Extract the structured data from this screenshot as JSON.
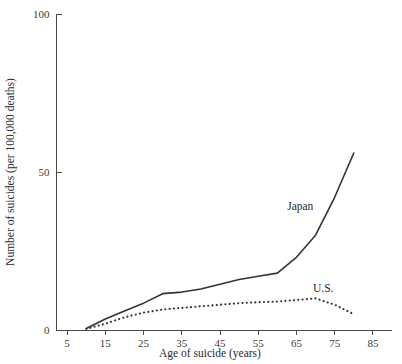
{
  "chart_data": {
    "type": "line",
    "title": "",
    "subtitle": "",
    "xlabel": "Age of suicide (years)",
    "ylabel": "Number of suicides (per 100,000 deaths)",
    "xlim": [
      0,
      90
    ],
    "ylim": [
      0,
      100
    ],
    "xticks": [
      5,
      15,
      25,
      35,
      45,
      55,
      65,
      75,
      85
    ],
    "xtick_labels": [
      "5",
      "15",
      "25",
      "35",
      "45",
      "55",
      "65",
      "75",
      "85"
    ],
    "yticks": [
      0,
      50,
      100
    ],
    "ytick_labels": [
      "0",
      "50",
      "100"
    ],
    "grid": false,
    "legend_position": "inline-annotation",
    "series": [
      {
        "name": "Japan",
        "style": "solid",
        "color": "#333333",
        "label_x": 66,
        "label_y": 38,
        "x": [
          10,
          15,
          20,
          25,
          30,
          35,
          40,
          45,
          50,
          55,
          60,
          65,
          70,
          75,
          80
        ],
        "values": [
          0.5,
          3.5,
          6.0,
          8.5,
          11.5,
          12.0,
          13.0,
          14.5,
          16.0,
          17.0,
          18.0,
          23.0,
          30.0,
          42.0,
          56.0
        ]
      },
      {
        "name": "U.S.",
        "style": "dotted",
        "color": "#333333",
        "label_x": 72,
        "label_y": 12,
        "x": [
          10,
          15,
          20,
          25,
          30,
          35,
          40,
          45,
          50,
          55,
          60,
          65,
          70,
          75,
          80
        ],
        "values": [
          0.3,
          2.0,
          4.0,
          5.5,
          6.5,
          7.0,
          7.5,
          8.0,
          8.5,
          8.8,
          9.0,
          9.5,
          10.0,
          8.0,
          5.0
        ]
      }
    ],
    "annotations": [
      {
        "text": "Japan",
        "x": 66,
        "y": 38
      },
      {
        "text": "U.S.",
        "x": 72,
        "y": 12
      }
    ]
  },
  "axes": {
    "x_axis_name": "age-axis",
    "y_axis_name": "suicide-rate-axis"
  }
}
